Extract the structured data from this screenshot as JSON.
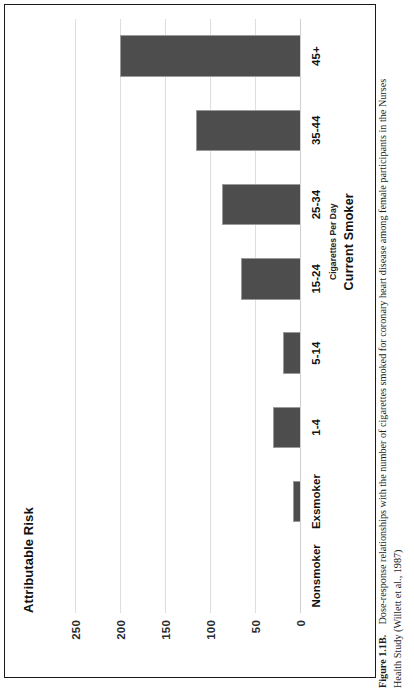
{
  "figure": {
    "label": "Figure 1.1B.",
    "caption_line1": "Dose-response relationships with the number of cigarettes smoked for coronary heart disease among female participants in the Nurses",
    "caption_line2": "Health Study (Willett et al., 1987)"
  },
  "chart_data": {
    "type": "bar",
    "title": "Attributable Risk",
    "xlabel": "Current Smoker",
    "x_sublabel": "Cigarettes Per Day",
    "ylabel": "",
    "categories": [
      "Nonsmoker",
      "Exsmoker",
      "1-4",
      "5-14",
      "15-24",
      "25-34",
      "35-44",
      "45+"
    ],
    "values": [
      0,
      9,
      31,
      20,
      66,
      88,
      117,
      201
    ],
    "ylim": [
      0,
      275
    ],
    "yticks": [
      0,
      50,
      100,
      150,
      200,
      250
    ],
    "ytick_labels": [
      "0",
      "50",
      "100",
      "150",
      "200",
      "250"
    ],
    "grid": true,
    "legend": "none",
    "bar_color": "#4d4d4d"
  }
}
